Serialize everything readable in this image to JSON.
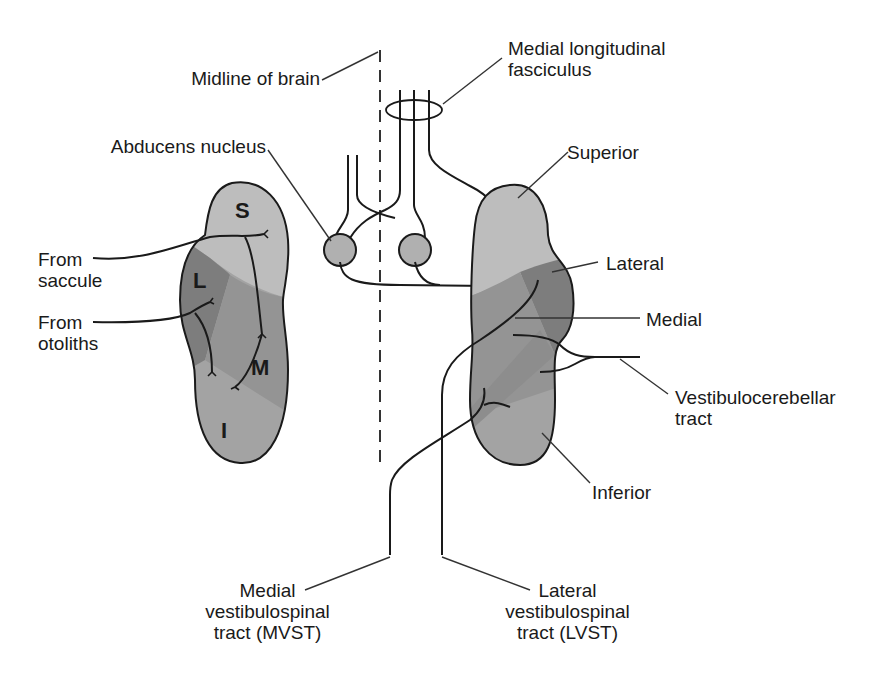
{
  "diagram": {
    "colors": {
      "superior_fill": "#bdbdbd",
      "lateral_fill": "#7d7d7d",
      "medial_fill": "#949494",
      "inferior_fill": "#a3a3a3",
      "abducens_fill": "#b0b0b0",
      "stroke": "#1a1a1a",
      "leader": "#333333"
    },
    "labels": {
      "midline": "Midline of brain",
      "mlf_line1": "Medial longitudinal",
      "mlf_line2": "fasciculus",
      "abducens": "Abducens nucleus",
      "superior": "Superior",
      "lateral": "Lateral",
      "medial": "Medial",
      "vestibulocerebellar_line1": "Vestibulocerebellar",
      "vestibulocerebellar_line2": "tract",
      "inferior": "Inferior",
      "from_saccule_line1": "From",
      "from_saccule_line2": "saccule",
      "from_otoliths_line1": "From",
      "from_otoliths_line2": "otoliths",
      "mvst_line1": "Medial",
      "mvst_line2": "vestibulospinal",
      "mvst_line3": "tract (MVST)",
      "lvst_line1": "Lateral",
      "lvst_line2": "vestibulospinal",
      "lvst_line3": "tract (LVST)"
    },
    "nucleus_letters": {
      "superior": "S",
      "lateral": "L",
      "medial": "M",
      "inferior": "I"
    }
  }
}
